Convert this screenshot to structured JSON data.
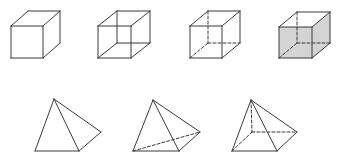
{
  "figure": {
    "colors": {
      "line": "#3a3a3a",
      "shade": "#d4d4d4",
      "background": "#ffffff"
    },
    "cubes": [
      {
        "id": "cube-1",
        "style": "solid-visible-edges-only",
        "front": {
          "x1": 11,
          "y1": 26,
          "x2": 43,
          "y2": 58
        },
        "back": {
          "x1": 28,
          "y1": 11,
          "x2": 60,
          "y2": 43
        },
        "show_hidden": "none",
        "shaded": false
      },
      {
        "id": "cube-2",
        "style": "wireframe-all-edges-solid",
        "front": {
          "x1": 98,
          "y1": 26,
          "x2": 131,
          "y2": 58
        },
        "back": {
          "x1": 117,
          "y1": 11,
          "x2": 150,
          "y2": 43
        },
        "show_hidden": "solid",
        "shaded": false
      },
      {
        "id": "cube-3",
        "style": "hidden-edges-dashed",
        "front": {
          "x1": 190,
          "y1": 26,
          "x2": 222,
          "y2": 58
        },
        "back": {
          "x1": 208,
          "y1": 11,
          "x2": 240,
          "y2": 43
        },
        "show_hidden": "dashed",
        "shaded": false
      },
      {
        "id": "cube-4",
        "style": "shaded-hidden-edges-dashed",
        "front": {
          "x1": 279,
          "y1": 27,
          "x2": 312,
          "y2": 58
        },
        "back": {
          "x1": 297,
          "y1": 12,
          "x2": 330,
          "y2": 43
        },
        "show_hidden": "dashed",
        "shaded": true
      }
    ],
    "pyramids": [
      {
        "id": "pyramid-1",
        "style": "visible-edges-only",
        "apex": [
          54,
          99
        ],
        "base_left": [
          35,
          151
        ],
        "base_mid": [
          79,
          151
        ],
        "right": [
          101,
          132
        ],
        "back": null,
        "hidden_edges": []
      },
      {
        "id": "pyramid-2",
        "style": "triangular-base-hidden-dashed",
        "apex": [
          153,
          100
        ],
        "base_left": [
          133,
          151
        ],
        "base_mid": [
          179,
          151
        ],
        "right": [
          200,
          132
        ],
        "back": null,
        "hidden_edges": [
          [
            "base_left",
            "right"
          ]
        ]
      },
      {
        "id": "pyramid-3",
        "style": "square-base-hidden-dashed",
        "apex": [
          251,
          100
        ],
        "base_left": [
          232,
          151
        ],
        "base_mid": [
          277,
          151
        ],
        "right": [
          297,
          132
        ],
        "back": [
          252,
          132
        ],
        "hidden_edges": [
          [
            "apex",
            "back"
          ],
          [
            "base_left",
            "back"
          ],
          [
            "back",
            "right"
          ]
        ]
      }
    ]
  }
}
